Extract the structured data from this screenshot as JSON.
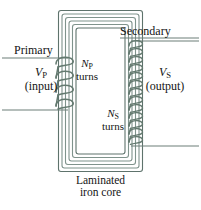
{
  "figure": {
    "colors": {
      "core_line": "#7f938c",
      "core_line_dark": "#5e736c",
      "coil": "#63796f",
      "lead": "#6d7f78",
      "text": "#141414",
      "background": "#ffffff"
    }
  },
  "labels": {
    "primary": "Primary",
    "secondary": "Secondary",
    "vp_symbol": "V",
    "vp_sub": "P",
    "vp_note": "(input)",
    "vs_symbol": "V",
    "vs_sub": "S",
    "vs_note": "(output)",
    "np_symbol": "N",
    "np_sub": "P",
    "np_note": "turns",
    "ns_symbol": "N",
    "ns_sub": "S",
    "ns_note": "turns",
    "core_line1": "Laminated",
    "core_line2": "iron core"
  },
  "diagram_data": {
    "type": "schematic",
    "core": {
      "shape": "rectangular-ring",
      "outer": {
        "x": 58,
        "y": 10,
        "width": 85,
        "height": 162
      },
      "lamination_count": 6,
      "window": {
        "x": 76,
        "y": 28,
        "width": 49,
        "height": 126
      }
    },
    "primary_winding": {
      "side": "left",
      "visible_turns": 4,
      "leads": [
        {
          "name": "primary-top-lead",
          "x1": 2,
          "y1": 58,
          "x2": 66,
          "y2": 58
        },
        {
          "name": "primary-bottom-lead",
          "x1": 2,
          "y1": 110,
          "x2": 66,
          "y2": 110
        }
      ]
    },
    "secondary_winding": {
      "side": "right",
      "visible_turns": 13,
      "leads": [
        {
          "name": "secondary-top-lead",
          "x1": 133,
          "y1": 41,
          "x2": 199,
          "y2": 41
        },
        {
          "name": "secondary-bottom-lead",
          "x1": 133,
          "y1": 146,
          "x2": 199,
          "y2": 146
        }
      ]
    },
    "pointer_lines": [
      {
        "name": "secondary-label-underline",
        "x1": 120,
        "y1": 38,
        "x2": 199,
        "y2": 38
      },
      {
        "name": "primary-label-underline",
        "x1": 12,
        "y1": 58,
        "x2": 66,
        "y2": 58
      }
    ]
  }
}
